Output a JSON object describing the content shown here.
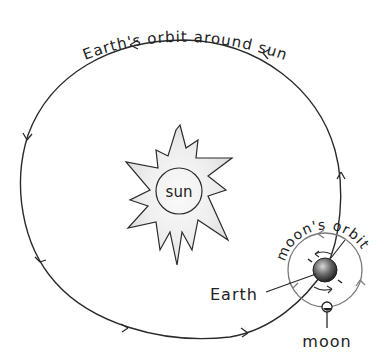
{
  "diagram": {
    "orbit_label": "Earth's orbit around sun",
    "sun_label": "sun",
    "moon_orbit_label": "moon's orbit",
    "earth_label": "Earth",
    "moon_label": "moon"
  },
  "colors": {
    "line": "#2a2a2a",
    "sun_fill": "#e6e6e6",
    "moon_orbit": "#7a7a7a",
    "earth_dark": "#333333",
    "earth_light": "#d0d0d0"
  }
}
